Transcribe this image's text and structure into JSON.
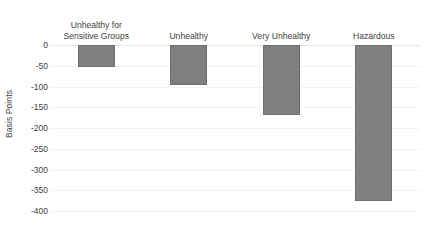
{
  "chart_data": {
    "type": "bar",
    "title": "",
    "subtitle": "",
    "xlabel": "",
    "ylabel": "Basis Points",
    "categories": [
      "Unhealthy for\nSensitive Groups",
      "Unhealthy",
      "Very Unhealthy",
      "Hazardous"
    ],
    "values": [
      -52,
      -97,
      -168,
      -375
    ],
    "ylim": [
      -400,
      0
    ],
    "ytick_values": [
      0,
      -50,
      -100,
      -150,
      -200,
      -250,
      -300,
      -350,
      -400
    ],
    "ytick_labels": [
      "0",
      "-50",
      "-100",
      "-150",
      "-200",
      "-250",
      "-300",
      "-350",
      "-400"
    ],
    "series": [
      {
        "name": "Basis Points",
        "values": [
          -52,
          -97,
          -168,
          -375
        ],
        "color": "#7f7f7f"
      }
    ],
    "grid": true,
    "grid_axis": "y",
    "grid_color": "#f2f2f2",
    "legend": false,
    "legend_position": "none",
    "bar_color": "#7f7f7f",
    "bar_border_color": "#6e6e6e",
    "background_color": "#ffffff",
    "text_color": "#404040",
    "annotations": []
  },
  "axis": {
    "y_title": "Basis Points"
  }
}
